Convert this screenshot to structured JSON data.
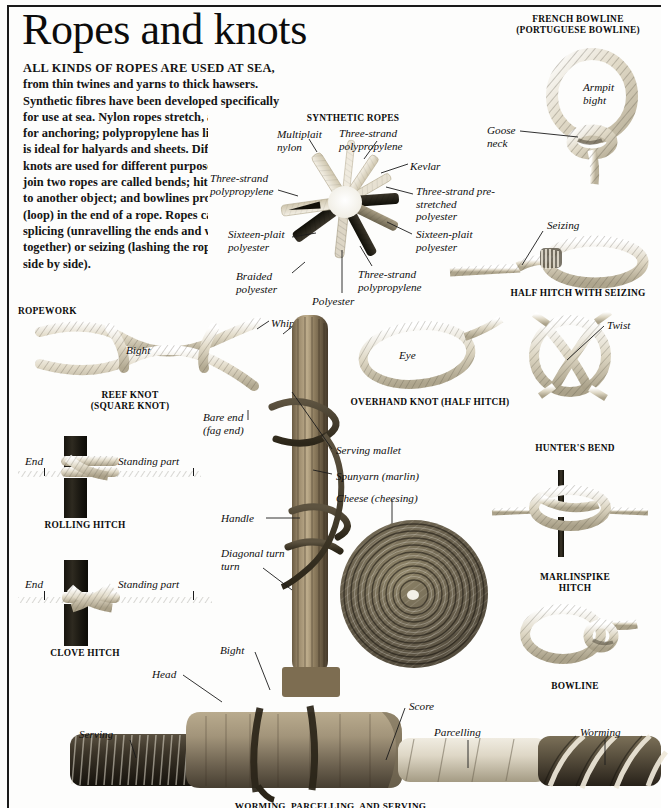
{
  "page": {
    "title": "Ropes and knots",
    "bottom_caption": "WORMING, PARCELLING, AND SERVING"
  },
  "intro": {
    "lead": "ALL KINDS OF ROPES ARE USED AT SEA,",
    "body": " from thin twines and yarns to thick hawsers. Synthetic fibres have been developed specifically for use at sea. Nylon ropes stretch, and so are ideal for anchoring; polypropylene has little stretch, so is ideal for halyards and sheets. Different types of knots are used for different purposes. Knots that join two ropes are called bends; hitches join a rope to another object; and bowlines produce an eye (loop) in the end of a rope. Ropes can be joined by splicing (unravelling the ends and weaving them together) or seizing (lashing the ropes together side by side)."
  },
  "sections": {
    "synthetic_ropes": {
      "heading": "SYNTHETIC ROPES",
      "labels": [
        "Multiplait nylon",
        "Three-strand polypropylene",
        "Kevlar",
        "Three-strand pre-stretched polyester",
        "Sixteen-plait polyester",
        "Three-strand polypropylene",
        "Polyester",
        "Braided polyester",
        "Sixteen-plait polyester",
        "Three-strand polypropylene"
      ]
    },
    "french_bowline": {
      "heading_line1": "FRENCH BOWLINE",
      "heading_line2": "(PORTUGUESE BOWLINE)",
      "labels": [
        "Armpit bight",
        "Goose neck"
      ]
    },
    "half_hitch_seizing": {
      "heading": "HALF HITCH WITH SEIZING",
      "labels": [
        "Seizing"
      ]
    },
    "ropework": {
      "heading": "ROPEWORK"
    },
    "reef_knot": {
      "heading_line1": "REEF KNOT",
      "heading_line2": "(SQUARE KNOT)",
      "labels": [
        "Bight",
        "Whipping",
        "Bare end",
        "(fag end)"
      ]
    },
    "rolling_hitch": {
      "heading": "ROLLING HITCH",
      "labels": [
        "End",
        "Standing part"
      ]
    },
    "clove_hitch": {
      "heading": "CLOVE HITCH",
      "labels": [
        "End",
        "Standing part"
      ]
    },
    "overhand_knot": {
      "heading": "OVERHAND KNOT (HALF HITCH)",
      "labels": [
        "Eye"
      ]
    },
    "hunters_bend": {
      "heading": "HUNTER'S BEND",
      "labels": [
        "Twist"
      ]
    },
    "marlinspike_hitch": {
      "heading_line1": "MARLINSPIKE",
      "heading_line2": "HITCH"
    },
    "bowline": {
      "heading": "BOWLINE"
    },
    "serving_mallet": {
      "labels": [
        "Serving mallet",
        "Spunyarn (marlin)",
        "Cheese (cheesing)",
        "Handle",
        "Diagonal turn",
        "Bight",
        "Head"
      ]
    },
    "worming": {
      "labels": [
        "Serving",
        "Score",
        "Parcelling",
        "Worming"
      ]
    }
  },
  "colors": {
    "ink": "#111111",
    "rule": "#1a1a1a",
    "paper": "#fdfdfc",
    "rope_light": "#ded4bd",
    "rope_dark": "#2b261d"
  }
}
